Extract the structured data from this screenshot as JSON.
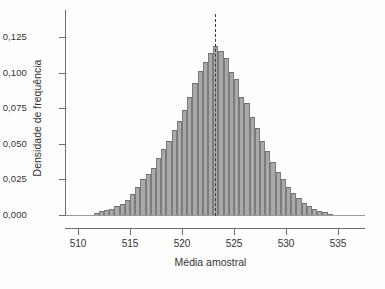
{
  "chart_data": {
    "type": "bar",
    "title": "",
    "subtitle": "",
    "xlabel": "Média amostral",
    "ylabel": "Densidade de frequência",
    "xlim": [
      508.0,
      538.5
    ],
    "ylim": [
      0.0,
      0.132
    ],
    "xticks": [
      510,
      515,
      520,
      525,
      530,
      535
    ],
    "xtick_labels": [
      "510",
      "515",
      "520",
      "525",
      "530",
      "535"
    ],
    "yticks": [
      0.0,
      0.025,
      0.05,
      0.075,
      0.1,
      0.125
    ],
    "ytick_labels": [
      "0,000",
      "0,025",
      "0,050",
      "0,075",
      "0,100",
      "0,125"
    ],
    "grid": false,
    "legend": null,
    "bin_width": 0.5,
    "bar_color": "#a9a9a9",
    "bar_edge_color": "#7c7c7c",
    "annotations": [
      {
        "name": "population-mean-reference-line",
        "type": "vline",
        "x": 523.2,
        "style": "dashed",
        "color": "#3a3a3a",
        "label": ""
      }
    ],
    "categories": [
      511.75,
      512.25,
      512.75,
      513.25,
      513.75,
      514.25,
      514.75,
      515.25,
      515.75,
      516.25,
      516.75,
      517.25,
      517.75,
      518.25,
      518.75,
      519.25,
      519.75,
      520.25,
      520.75,
      521.25,
      521.75,
      522.25,
      522.75,
      523.25,
      523.75,
      524.25,
      524.75,
      525.25,
      525.75,
      526.25,
      526.75,
      527.25,
      527.75,
      528.25,
      528.75,
      529.25,
      529.75,
      530.25,
      530.75,
      531.25,
      531.75,
      532.25,
      532.75,
      533.25,
      533.75,
      534.25
    ],
    "values": [
      0.0015,
      0.0025,
      0.0035,
      0.0045,
      0.006,
      0.008,
      0.0105,
      0.015,
      0.02,
      0.0255,
      0.029,
      0.033,
      0.04,
      0.046,
      0.052,
      0.06,
      0.066,
      0.074,
      0.083,
      0.093,
      0.101,
      0.1075,
      0.114,
      0.119,
      0.1155,
      0.11,
      0.1005,
      0.0955,
      0.083,
      0.079,
      0.069,
      0.061,
      0.052,
      0.045,
      0.0375,
      0.0305,
      0.025,
      0.0195,
      0.0155,
      0.012,
      0.0085,
      0.006,
      0.0045,
      0.003,
      0.0018,
      0.001
    ]
  }
}
